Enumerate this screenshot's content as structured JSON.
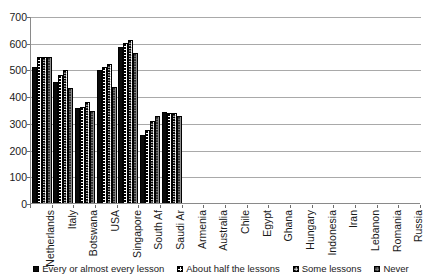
{
  "chart_data": {
    "type": "bar",
    "title": "",
    "xlabel": "",
    "ylabel": "",
    "ylim": [
      0,
      700
    ],
    "ytick_step": 100,
    "yticks": [
      0,
      100,
      200,
      300,
      400,
      500,
      600,
      700
    ],
    "ytick_labels": [
      "0",
      "100",
      "200",
      "300",
      "400",
      "500",
      "600",
      "700"
    ],
    "grid": true,
    "grid_axis": "y",
    "legend_position": "bottom",
    "categories": [
      "Netherlands",
      "Italy",
      "Botswana",
      "USA",
      "Singapore",
      "South Af",
      "Saudi Ar",
      "Armenia",
      "Australia",
      "Chile",
      "Egypt",
      "Ghana",
      "Hungary",
      "Indonesia",
      "Iran",
      "Lebanon",
      "Romania",
      "Russia"
    ],
    "series": [
      {
        "name": "Every or almost every lesson",
        "values": [
          510,
          453,
          355,
          498,
          583,
          255,
          342,
          null,
          null,
          null,
          null,
          null,
          null,
          null,
          null,
          null,
          null,
          null
        ]
      },
      {
        "name": "About half the lessons",
        "values": [
          548,
          480,
          358,
          508,
          600,
          272,
          337,
          null,
          null,
          null,
          null,
          null,
          null,
          null,
          null,
          null,
          null,
          null
        ]
      },
      {
        "name": "Some lessons",
        "values": [
          548,
          497,
          380,
          520,
          610,
          307,
          337,
          null,
          null,
          null,
          null,
          null,
          null,
          null,
          null,
          null,
          null,
          null
        ]
      },
      {
        "name": "Never",
        "values": [
          548,
          430,
          345,
          433,
          563,
          325,
          325,
          null,
          null,
          null,
          null,
          null,
          null,
          null,
          null,
          null,
          null,
          null
        ]
      }
    ]
  },
  "legend": {
    "entries": [
      "Every or almost every lesson",
      "About half the lessons",
      "Some lessons",
      "Never"
    ]
  }
}
